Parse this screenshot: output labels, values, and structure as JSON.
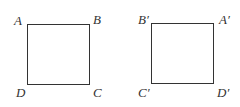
{
  "figures": [
    {
      "name": "square-ABCD",
      "labels": {
        "top_left": "A",
        "top_right": "B",
        "bottom_left": "D",
        "bottom_right": "C"
      }
    },
    {
      "name": "square-B'A'D'C'",
      "labels": {
        "top_left": "B′",
        "top_right": "A′",
        "bottom_left": "C′",
        "bottom_right": "D′"
      }
    }
  ]
}
